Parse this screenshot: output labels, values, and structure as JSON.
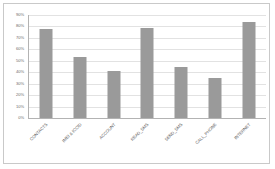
{
  "chart_data": {
    "type": "bar",
    "title": "",
    "subtitle": "",
    "xlabel": "",
    "ylabel": "",
    "categories": [
      "CONTACTS",
      "IMEI & ICCID",
      "ACCOUNT",
      "READ_SMS",
      "SEND_SMS",
      "CALL_PHONE",
      "INTERNET"
    ],
    "values": [
      78,
      53,
      41,
      79,
      45,
      35,
      84
    ],
    "value_suffix": "%",
    "ylim": [
      0,
      90
    ],
    "ytick_step": 10,
    "ytick_labels": [
      "0%",
      "10%",
      "20%",
      "30%",
      "40%",
      "50%",
      "60%",
      "70%",
      "80%",
      "90%"
    ],
    "ytick_values": [
      0,
      10,
      20,
      30,
      40,
      50,
      60,
      70,
      80,
      90
    ],
    "grid": true,
    "grid_axis": "y",
    "legend": false,
    "legend_position": "none",
    "xtick_rotation_deg": -45,
    "colors": {
      "bar": "#9a9a9a",
      "gridline": "#e2e2e2",
      "axis": "#b3b3b3",
      "frame": "#c9c9c9",
      "background": "#ffffff",
      "tick_text": "#6b6b6b",
      "category_text": "#5e5e5e"
    }
  }
}
